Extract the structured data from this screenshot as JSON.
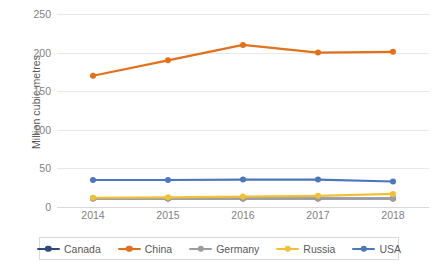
{
  "chart_data": {
    "type": "line",
    "title": "",
    "xlabel": "",
    "ylabel": "Million cubic metres",
    "categories": [
      "2014",
      "2015",
      "2016",
      "2017",
      "2018"
    ],
    "x": [
      2014,
      2015,
      2016,
      2017,
      2018
    ],
    "ylim": [
      0,
      250
    ],
    "yticks": [
      0,
      50,
      100,
      150,
      200,
      250
    ],
    "ytick_labels": [
      "0",
      "50",
      "100",
      "150",
      "200",
      "250"
    ],
    "grid": "horizontal",
    "legend_position": "bottom",
    "series": [
      {
        "name": "Canada",
        "color": "#2e4b7c",
        "values": [
          11,
          11,
          11,
          11,
          11
        ]
      },
      {
        "name": "China",
        "color": "#e3701a",
        "values": [
          170,
          190,
          210,
          200,
          201
        ]
      },
      {
        "name": "Germany",
        "color": "#9d9d9d",
        "values": [
          11,
          11,
          11,
          11,
          11
        ]
      },
      {
        "name": "Russia",
        "color": "#f2c037",
        "values": [
          12,
          12.5,
          13.5,
          14.5,
          17
        ]
      },
      {
        "name": "USA",
        "color": "#4a77bd",
        "values": [
          35,
          35,
          35.5,
          35.5,
          33
        ]
      }
    ]
  },
  "axis_style": {
    "gridline_color": "#e8e8e8",
    "baseline_color": "#d9d9d9",
    "tick_text_color": "#7f7f7f",
    "axis_title_color": "#595959",
    "legend_border_color": "#d9d9d9",
    "background": "#ffffff"
  }
}
